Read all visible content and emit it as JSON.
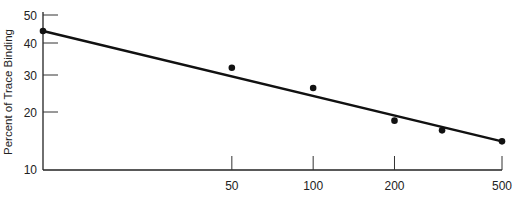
{
  "chart_data": {
    "type": "scatter",
    "title": "",
    "xlabel": "",
    "ylabel": "Percent of Trace Binding",
    "xscale": "log",
    "yscale": "log",
    "xlim": [
      10,
      500
    ],
    "ylim": [
      10,
      50
    ],
    "x_ticks": [
      50,
      100,
      200,
      500
    ],
    "x_tick_labels": [
      "50",
      "100",
      "200",
      "500"
    ],
    "y_ticks": [
      10,
      20,
      30,
      40,
      50
    ],
    "y_tick_labels": [
      "10",
      "20",
      "30",
      "40",
      "50"
    ],
    "grid": false,
    "legend": "none",
    "series": [
      {
        "name": "observed",
        "type": "scatter",
        "x": [
          10,
          50,
          100,
          200,
          300,
          500
        ],
        "y": [
          44,
          32,
          26,
          18,
          16,
          14
        ]
      },
      {
        "name": "fit",
        "type": "line",
        "x": [
          10,
          500
        ],
        "y": [
          44,
          14
        ]
      }
    ]
  }
}
